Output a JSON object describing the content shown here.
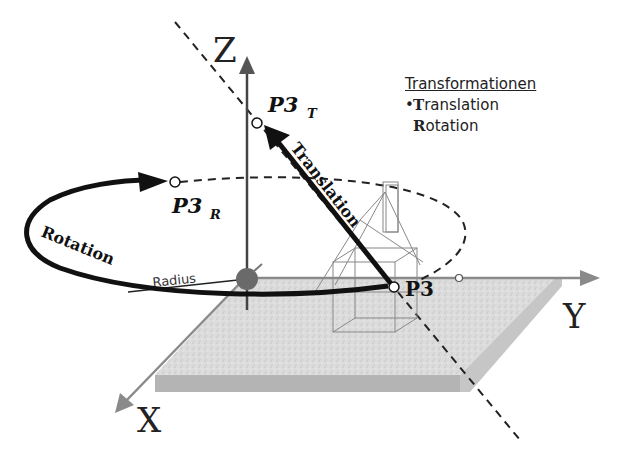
{
  "diagram": {
    "axes": {
      "x_label": "X",
      "y_label": "Y",
      "z_label": "Z"
    },
    "points": {
      "p3": "P3",
      "p3t_main": "P3",
      "p3t_sub": "T",
      "p3r_main": "P3",
      "p3r_sub": "R"
    },
    "paths": {
      "translation_label": "Translation",
      "rotation_label": "Rotation",
      "radius_label": "Radius"
    },
    "legend": {
      "title": "Transformationen",
      "items": [
        {
          "bullet": "•",
          "initial": "T",
          "rest": "ranslation"
        },
        {
          "bullet": "",
          "initial": "R",
          "rest": "otation"
        }
      ]
    },
    "colors": {
      "axis": "#8a8a8a",
      "plane": "#d6d6d6",
      "plane_edge": "#b0b0b0",
      "arrow": "#111111",
      "origin": "#6a6a6a"
    }
  }
}
